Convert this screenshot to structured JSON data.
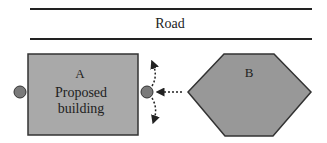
{
  "road": {
    "label": "Road"
  },
  "building_a": {
    "letter": "A",
    "line1": "Proposed",
    "line2": "building"
  },
  "building_b": {
    "letter": "B"
  },
  "colors": {
    "fill": "#a9a9a9",
    "hex_fill": "#989898",
    "stroke": "#333333",
    "marker": "#7a7a7a",
    "road_line": "#222222"
  }
}
